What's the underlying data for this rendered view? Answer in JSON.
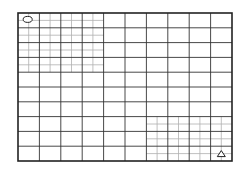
{
  "diagram": {
    "type": "grid-map",
    "frame": {
      "left": 18,
      "top": 13,
      "right": 232,
      "bottom": 161
    },
    "major_grid": {
      "columns": 10,
      "rows": 10
    },
    "fine_regions": [
      {
        "name": "top-left-fine-grid",
        "col_start": 0,
        "col_end": 4,
        "row_start": 0,
        "row_end": 4,
        "subdivisions": 2
      },
      {
        "name": "bottom-right-fine-grid",
        "col_start": 6,
        "col_end": 10,
        "row_start": 7,
        "row_end": 10,
        "subdivisions": 2
      }
    ],
    "markers": [
      {
        "name": "start-oval-marker",
        "shape": "ellipse",
        "col": 0,
        "row": 0
      },
      {
        "name": "goal-triangle-marker",
        "shape": "triangle",
        "col": 9,
        "row": 9
      }
    ],
    "colors": {
      "major_line": "#333333",
      "fine_line": "#b0b0b0",
      "frame": "#222222",
      "background": "#ffffff"
    }
  }
}
